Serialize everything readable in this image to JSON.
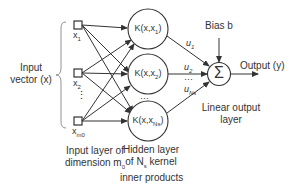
{
  "diagram": {
    "input_label": [
      "Input",
      "vector (x)"
    ],
    "input_nodes": [
      {
        "label": "x",
        "sub": "1"
      },
      {
        "label": "x",
        "sub": "2"
      },
      {
        "label": "x",
        "sub": "m0"
      }
    ],
    "hidden_nodes": [
      {
        "label": "K(x,x",
        "sub": "1",
        "close": ")"
      },
      {
        "label": "K(x,x",
        "sub": "2",
        "close": ")"
      },
      {
        "label": "K(x,x",
        "sub": "Ns",
        "close": ")"
      }
    ],
    "weights": [
      {
        "label": "u",
        "sub": "1"
      },
      {
        "label": "u",
        "sub": "2"
      },
      {
        "label": "u",
        "sub": "Ns"
      }
    ],
    "bias_label": "Bias b",
    "sum_symbol": "Σ",
    "output_label": "Output (y)",
    "input_layer_caption": [
      "Input layer of",
      "dimension m",
      "0"
    ],
    "hidden_layer_caption": [
      "Hidden layer",
      "of N",
      "s",
      " kernel",
      "inner products"
    ],
    "output_layer_caption": [
      "Linear output",
      "layer"
    ],
    "ellipsis": "⋮",
    "hellipsis": "···"
  }
}
